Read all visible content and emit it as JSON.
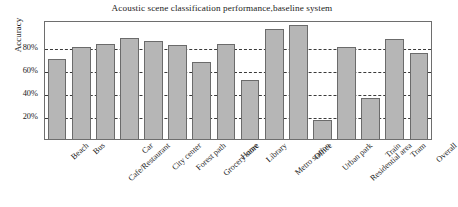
{
  "chart_data": {
    "type": "bar",
    "title": "Acoustic scene classification performance,baseline system",
    "xlabel": "",
    "ylabel": "Accuracy",
    "ylim": [
      0,
      104
    ],
    "grid": true,
    "legend": null,
    "y_ticks": [
      {
        "value": 20,
        "label": "20%"
      },
      {
        "value": 40,
        "label": "40%"
      },
      {
        "value": 60,
        "label": "60%"
      },
      {
        "value": 80,
        "label": "80%"
      }
    ],
    "categories": [
      "Beach",
      "Bus",
      "Cafe/Restaurant",
      "Car",
      "City center",
      "Forest path",
      "Grocery store",
      "Home",
      "Library",
      "Metro station",
      "Office",
      "Urban park",
      "Residential area",
      "Train",
      "Tram",
      "Overall"
    ],
    "values": [
      70,
      80,
      83,
      88,
      86,
      82,
      67,
      83,
      52,
      96,
      100,
      17,
      80,
      36,
      87,
      75
    ],
    "bar_color": "#b6b6b6",
    "bar_edge_color": "#6b6b6b",
    "grid_color": "#3a3a3a",
    "axis_color": "#6e6e6e"
  }
}
